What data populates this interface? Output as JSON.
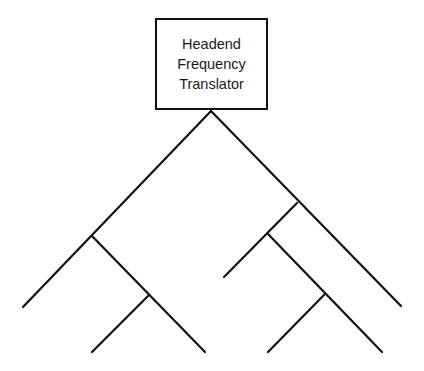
{
  "diagram": {
    "type": "tree-and-branch network",
    "root": {
      "label_lines": [
        "Headend",
        "Frequency",
        "Translator"
      ]
    },
    "colors": {
      "stroke": "#111111",
      "background": "#ffffff",
      "text": "#1a1a1a"
    },
    "branches": [
      {
        "id": "left-trunk",
        "x1": 211,
        "y1": 111,
        "x2": 23,
        "y2": 307
      },
      {
        "id": "left-sub-branch",
        "x1": 92,
        "y1": 236,
        "x2": 205,
        "y2": 352
      },
      {
        "id": "left-sub-leaf",
        "x1": 149,
        "y1": 295,
        "x2": 92,
        "y2": 352
      },
      {
        "id": "right-trunk",
        "x1": 211,
        "y1": 111,
        "x2": 401,
        "y2": 306
      },
      {
        "id": "right-branch",
        "x1": 297,
        "y1": 203,
        "x2": 224,
        "y2": 277
      },
      {
        "id": "right-sub-branch",
        "x1": 268,
        "y1": 234,
        "x2": 382,
        "y2": 352
      },
      {
        "id": "right-sub-leaf",
        "x1": 324,
        "y1": 295,
        "x2": 268,
        "y2": 352
      }
    ]
  }
}
